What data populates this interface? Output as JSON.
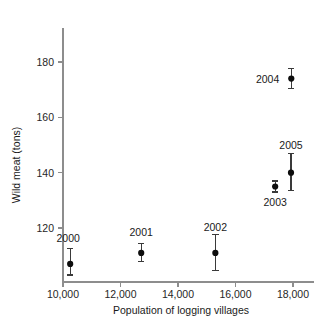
{
  "figure": {
    "cut_off_top_text": "",
    "background_color": "#ffffff",
    "marker_color": "#0d0d0d",
    "axis_color": "#8d8d8d"
  },
  "chart_data": {
    "type": "scatter",
    "title": "",
    "xlabel": "Population of logging villages",
    "ylabel": "Wild meat (tons)",
    "xlim": [
      9300,
      19200
    ],
    "ylim": [
      102,
      188
    ],
    "grid": false,
    "legend": null,
    "xticks": [
      10000,
      12000,
      14000,
      16000,
      18000
    ],
    "xticklabels": [
      "10,000",
      "12,000",
      "14,000",
      "16,000",
      "18,000"
    ],
    "yticks": [
      120,
      140,
      160,
      180
    ],
    "yticklabels": [
      "120",
      "140",
      "160",
      "180"
    ],
    "error_bars": "vertical, with caps",
    "points": [
      {
        "label": "2000",
        "x": 10250,
        "y": 107.0,
        "yerr_low": 103.0,
        "yerr_high": 112.5,
        "label_dx": -2,
        "label_dy": -22,
        "label_anchor": "middle"
      },
      {
        "label": "2001",
        "x": 12720,
        "y": 111.0,
        "yerr_low": 108.0,
        "yerr_high": 114.5,
        "label_dx": 0,
        "label_dy": -17,
        "label_anchor": "middle"
      },
      {
        "label": "2002",
        "x": 15300,
        "y": 111.0,
        "yerr_low": 104.5,
        "yerr_high": 117.5,
        "label_dx": 0,
        "label_dy": -22,
        "label_anchor": "middle"
      },
      {
        "label": "2003",
        "x": 17380,
        "y": 135.0,
        "yerr_low": 133.0,
        "yerr_high": 137.0,
        "label_dx": 0,
        "label_dy": 19,
        "label_anchor": "middle"
      },
      {
        "label": "2004",
        "x": 17940,
        "y": 174.0,
        "yerr_low": 170.5,
        "yerr_high": 177.5,
        "label_dx": -12,
        "label_dy": 4,
        "label_anchor": "end"
      },
      {
        "label": "2005",
        "x": 17930,
        "y": 140.0,
        "yerr_low": 133.5,
        "yerr_high": 147.0,
        "label_dx": 0,
        "label_dy": -24,
        "label_anchor": "middle"
      }
    ]
  }
}
